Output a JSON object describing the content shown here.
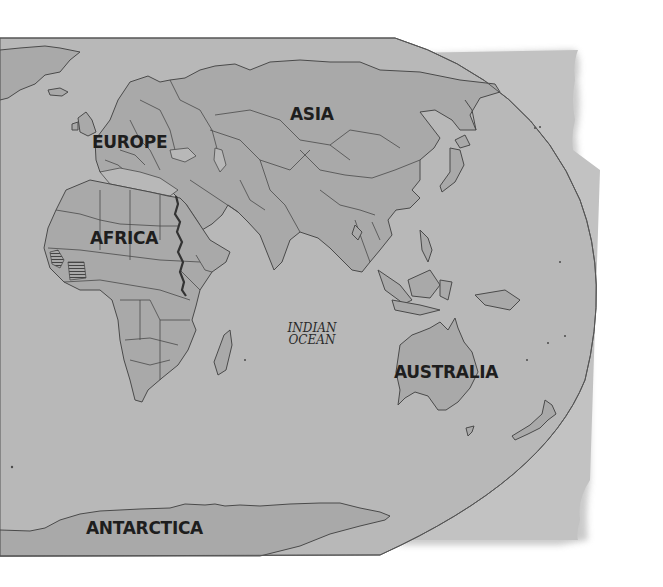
{
  "map": {
    "type": "world-map-eastern-hemisphere",
    "style": "grayscale political outline map",
    "colors": {
      "ocean": "#b8b8b8",
      "land": "#a9a9a9",
      "border": "#4a4a4a",
      "paper_back": "#c2c2c2",
      "nile": "#333333",
      "background": "#ffffff"
    },
    "labels": {
      "europe": "EUROPE",
      "asia": "ASIA",
      "africa": "AFRICA",
      "australia": "AUSTRALIA",
      "antarctica": "ANTARCTICA",
      "indian_ocean_line1": "INDIAN",
      "indian_ocean_line2": "OCEAN"
    },
    "highlighted_features": [
      "Nile River (bold line)",
      "West Africa striped countries"
    ]
  }
}
